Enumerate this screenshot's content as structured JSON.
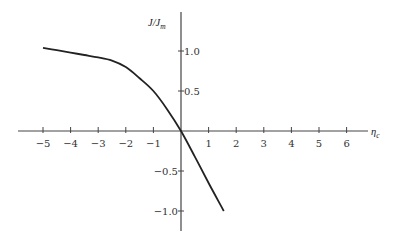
{
  "chart_data": {
    "type": "line",
    "title": "",
    "xlabel": "η_c",
    "ylabel": "J/J_m",
    "xlabel_parts": {
      "main": "η",
      "sub": "c"
    },
    "ylabel_parts": {
      "main": "J/J",
      "sub": "m"
    },
    "xlim": [
      -6.0,
      6.7
    ],
    "ylim": [
      -1.25,
      1.45
    ],
    "grid": false,
    "legend": null,
    "x_ticks": [
      -5,
      -4,
      -3,
      -2,
      -1,
      1,
      2,
      3,
      4,
      5,
      6
    ],
    "x_tick_labels": [
      "−5",
      "−4",
      "−3",
      "−2",
      "−1",
      "1",
      "2",
      "3",
      "4",
      "5",
      "6"
    ],
    "y_ticks": [
      1.0,
      0.5,
      -0.5,
      -1.0
    ],
    "y_tick_labels": [
      "1.0",
      "0.5",
      "−0.5",
      "−1.0"
    ],
    "series": [
      {
        "name": "J/J_m vs η_c",
        "x": [
          -5.0,
          -4.5,
          -4.0,
          -3.5,
          -3.0,
          -2.5,
          -2.0,
          -1.5,
          -1.0,
          -0.5,
          0.0,
          0.5,
          1.0,
          1.55
        ],
        "y": [
          1.04,
          1.01,
          0.98,
          0.95,
          0.92,
          0.88,
          0.8,
          0.66,
          0.5,
          0.27,
          0.0,
          -0.32,
          -0.65,
          -1.0
        ]
      }
    ]
  },
  "axes": {
    "x_label_main": "η",
    "x_label_sub": "c",
    "y_label_main": "J/J",
    "y_label_sub": "m"
  }
}
